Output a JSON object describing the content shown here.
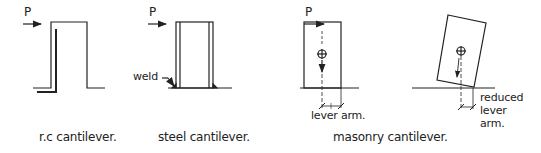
{
  "figure": {
    "load_label": "P",
    "panels": [
      {
        "id": "rc",
        "caption": "r.c cantilever."
      },
      {
        "id": "steel",
        "caption": "steel cantilever.",
        "annotation": "weld"
      },
      {
        "id": "masonry",
        "caption": "masonry cantilever.",
        "annotations": [
          "lever arm.",
          "reduced",
          "lever",
          "arm."
        ]
      }
    ]
  },
  "colors": {
    "line": "#222222",
    "background": "#ffffff"
  }
}
